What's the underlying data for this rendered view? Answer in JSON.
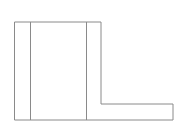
{
  "diagram": {
    "type": "line-drawing",
    "stroke_color": "#8a8a8a",
    "background": "#ffffff",
    "outline_points": [
      [
        14.5,
        22
      ],
      [
        101,
        22
      ],
      [
        101,
        104
      ],
      [
        173,
        104
      ],
      [
        173,
        120
      ],
      [
        14.5,
        120
      ]
    ],
    "dividers": [
      {
        "x": 30.5,
        "y1": 22,
        "y2": 120
      },
      {
        "x": 86.5,
        "y1": 22,
        "y2": 120
      }
    ]
  }
}
